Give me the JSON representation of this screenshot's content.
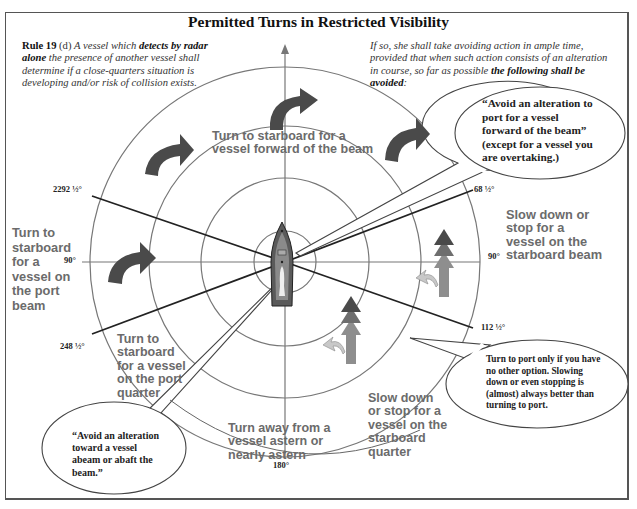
{
  "title": "Permitted Turns in Restricted Visibility",
  "rule_text": {
    "rule_label": "Rule 19",
    "rule_clause": " (d) ",
    "part1": "A vessel which ",
    "bold1": "detects by radar alone",
    "part2": " the presence of another vessel shall determine if a close-quarters situation is developing and/or risk of collision exists."
  },
  "avoid_text": {
    "part1": "If so, she shall take avoiding action in ample time, provided that when such action consists of an alteration in course, so far as possible ",
    "bold1": "the following shall be avoided",
    "part2": ":"
  },
  "sectors": {
    "forward": "Turn to starboard for a vessel forward of the beam",
    "port_beam": "Turn to starboard for a vessel on the port beam",
    "starboard_beam": "Slow down or stop for a vessel on the starboard beam",
    "port_quarter": "Turn to starboard for a vessel on the port quarter",
    "starboard_quarter": "Slow down or stop for a vessel on the starboard quarter",
    "astern": "Turn away from a vessel astern or nearly astern"
  },
  "bubbles": {
    "forward_port": "“Avoid an alteration to port for a vessel forward of the beam” (except for a vessel you are overtaking.)",
    "abeam": "“Avoid an alteration toward a vessel abeam or abaft the beam.”",
    "port_only": "Turn to port only if you have no other option. Slowing down or even stopping is (almost) always better than turning to port."
  },
  "bearings": {
    "b292": "2292 ½°",
    "b068": "68 ½°",
    "b090_left": "90°",
    "b090_right": "90°",
    "b112": "112 ½°",
    "b248": "248 ½°",
    "b180": "180°"
  },
  "colors": {
    "arrow_dark": "#4a4a4a",
    "arrow_mid": "#6e6e6e",
    "arrow_light": "#8e8e8e",
    "arrow_pale": "#c8c8c8",
    "circle": "#777777",
    "sector_text": "#6b6b6b",
    "boat_hull": "#5a5a5a",
    "boat_deck": "#8a8a8a"
  }
}
